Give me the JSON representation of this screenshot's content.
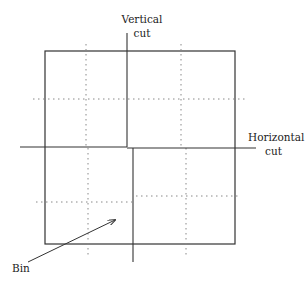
{
  "diagram": {
    "labels": {
      "vertical_cut_line1": "Vertical",
      "vertical_cut_line2": "cut",
      "horizontal_cut_line1": "Horizontal",
      "horizontal_cut_line2": "cut",
      "bin": "Bin"
    },
    "colors": {
      "solid_line": "#333333",
      "dotted_line": "#888888",
      "text": "#222222"
    },
    "outer_box": {
      "x1": 45,
      "y1": 51,
      "x2": 235,
      "y2": 244
    },
    "vertical_cut": {
      "upper_x": 127,
      "upper_y1": 33,
      "upper_y2": 147,
      "lower_x": 133,
      "lower_y1": 148,
      "lower_y2": 262
    },
    "horizontal_cut": {
      "y_left": 147,
      "y_right": 148,
      "x1": 20,
      "x2": 256
    },
    "dotted_lines": [
      {
        "orient": "v",
        "x": 86,
        "y1": 44,
        "y2": 147
      },
      {
        "orient": "v",
        "x": 181,
        "y1": 44,
        "y2": 147
      },
      {
        "orient": "h",
        "y": 99,
        "x1": 33,
        "x2": 247
      },
      {
        "orient": "v",
        "x": 88,
        "y1": 148,
        "y2": 256
      },
      {
        "orient": "v",
        "x": 186,
        "y1": 148,
        "y2": 256
      },
      {
        "orient": "h",
        "y": 202,
        "x1": 36,
        "x2": 132
      },
      {
        "orient": "h",
        "y": 196,
        "x1": 136,
        "x2": 240
      }
    ],
    "arrow": {
      "x1": 28,
      "y1": 262,
      "x2": 115,
      "y2": 220
    }
  }
}
